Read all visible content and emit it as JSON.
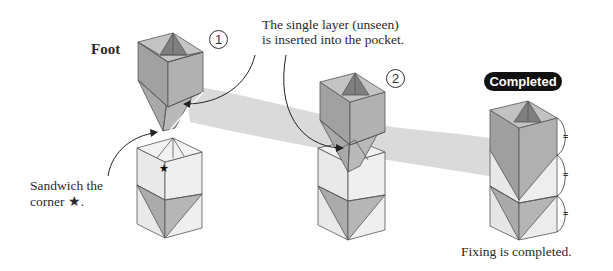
{
  "diagram": {
    "type": "origami-instruction",
    "labels": {
      "part_name": "Foot",
      "instruction_top_line1": "The single layer (unseen)",
      "instruction_top_line2": "is inserted into the pocket.",
      "instruction_left_line1": "Sandwich the",
      "instruction_left_line2": "corner ★.",
      "completion_note": "Fixing is completed.",
      "completed_badge": "Completed"
    },
    "steps": [
      {
        "number": "1",
        "description": "Foot unit positioned above base box"
      },
      {
        "number": "2",
        "description": "Foot point inserted into base box pocket"
      }
    ],
    "markers": {
      "star": "★",
      "equal_marks": [
        "=",
        "=",
        "="
      ]
    },
    "colors": {
      "dark_face": "#9a9a9a",
      "mid_face": "#b4b4b4",
      "light_face": "#e6e6e6",
      "inner_dark": "#7d7d7d",
      "band": "#d4d4d4",
      "outline": "#555555",
      "badge_bg": "#111111",
      "badge_text": "#ffffff"
    }
  }
}
